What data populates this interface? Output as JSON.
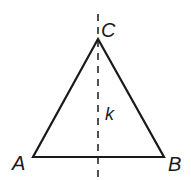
{
  "diagram": {
    "type": "isosceles-triangle-with-symmetry-axis",
    "stroke_color": "#1a1a1a",
    "vertices": {
      "A": {
        "label": "A",
        "x": 33,
        "y": 157
      },
      "B": {
        "label": "B",
        "x": 164,
        "y": 157
      },
      "C": {
        "label": "C",
        "x": 98,
        "y": 39
      }
    },
    "axis": {
      "label": "k",
      "x": 98,
      "y1": 14,
      "y2": 178,
      "style": "dashed"
    }
  }
}
